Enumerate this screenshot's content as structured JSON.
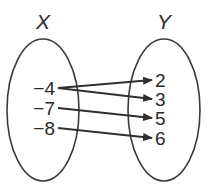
{
  "diagram": {
    "type": "mapping-diagram",
    "domain_set": {
      "label": "X",
      "elements": [
        "−4",
        "−7",
        "−8"
      ]
    },
    "range_set": {
      "label": "Y",
      "elements": [
        "2",
        "3",
        "5",
        "6"
      ]
    },
    "mappings": [
      {
        "from": "−4",
        "to": "2"
      },
      {
        "from": "−4",
        "to": "3"
      },
      {
        "from": "−7",
        "to": "5"
      },
      {
        "from": "−8",
        "to": "6"
      }
    ],
    "colors": {
      "stroke": "#3a3a3a",
      "text": "#2a2a2a",
      "background": "#ffffff"
    }
  }
}
